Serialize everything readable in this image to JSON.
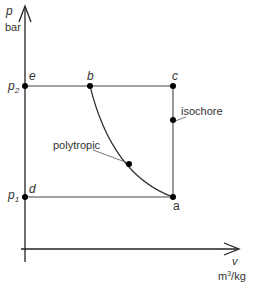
{
  "diagram": {
    "y_axis": {
      "symbol": "p",
      "unit": "bar"
    },
    "x_axis": {
      "symbol": "v",
      "unit_base": "m",
      "unit_exp": "3",
      "unit_rest": "/kg"
    },
    "pressure_levels": [
      {
        "symbol": "p",
        "sub": "2"
      },
      {
        "symbol": "p",
        "sub": "1"
      }
    ],
    "points": {
      "a": "a",
      "b": "b",
      "c": "c",
      "d": "d",
      "e": "e"
    },
    "annotations": {
      "isochore": "isochore",
      "polytropic": "polytropic"
    }
  }
}
